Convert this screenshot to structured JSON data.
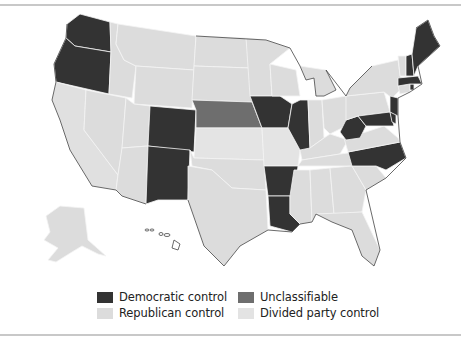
{
  "map": {
    "title": "",
    "colors": {
      "democratic": "#333333",
      "republican": "#dcdcdc",
      "unclassifiable": "#6e6e6e",
      "divided": "#e3e3e3",
      "border": "#f4f4f4",
      "outline": "#444444"
    },
    "states": {
      "democratic": [
        "WA",
        "OR",
        "CO",
        "NM",
        "IA",
        "IL",
        "AR",
        "LA",
        "WV",
        "NC",
        "MD",
        "DE",
        "NJ",
        "MA",
        "NH",
        "ME",
        "RI"
      ],
      "unclassifiable": [
        "NE"
      ],
      "divided": [
        "MO",
        "KS",
        "ID",
        "NV",
        "AZ",
        "MT",
        "ND",
        "SD",
        "MN",
        "WI",
        "MI",
        "IN",
        "OH",
        "KY",
        "TN",
        "VA",
        "PA",
        "NY",
        "VT",
        "CT",
        "CA",
        "UT",
        "WY",
        "OK",
        "TX",
        "MS",
        "AL",
        "GA",
        "SC",
        "FL",
        "AK"
      ],
      "outline_only": [
        "HI"
      ]
    }
  },
  "legend": {
    "items": [
      {
        "label": "Democratic control",
        "color": "#333333"
      },
      {
        "label": "Republican control",
        "color": "#dcdcdc"
      },
      {
        "label": "Unclassifiable",
        "color": "#6e6e6e"
      },
      {
        "label": "Divided party control",
        "color": "#e3e3e3"
      }
    ]
  }
}
